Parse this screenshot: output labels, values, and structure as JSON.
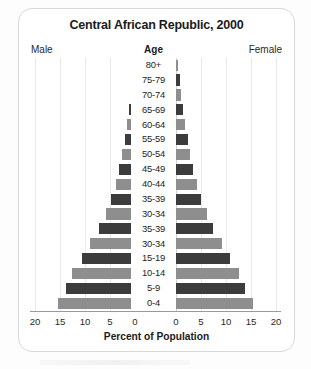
{
  "chart_data": {
    "type": "bar",
    "subtype": "population-pyramid",
    "title": "Central African Republic, 2000",
    "xlabel": "Percent of Population",
    "ylabel": "Age",
    "left_series_label": "Male",
    "right_series_label": "Female",
    "grid": true,
    "legend": "none",
    "xlim_left": [
      20,
      0
    ],
    "xlim_right": [
      0,
      20
    ],
    "xticks_left": [
      "20",
      "15",
      "10",
      "5",
      "0"
    ],
    "xticks_right": [
      "0",
      "5",
      "10",
      "15",
      "20"
    ],
    "categories": [
      "80+",
      "75-79",
      "70-74",
      "65-69",
      "60-64",
      "55-59",
      "50-54",
      "45-49",
      "40-44",
      "35-39",
      "30-34",
      "35-39",
      "30-34",
      "15-19",
      "10-14",
      "5-9",
      "0-4"
    ],
    "series": [
      {
        "name": "Male",
        "side": "left",
        "values": [
          0.3,
          0.6,
          0.9,
          1.3,
          1.7,
          2.1,
          2.6,
          3.2,
          3.9,
          4.8,
          5.9,
          7.3,
          9.0,
          10.6,
          12.6,
          13.9,
          15.5
        ]
      },
      {
        "name": "Female",
        "side": "right",
        "values": [
          0.4,
          0.7,
          1.0,
          1.4,
          1.8,
          2.3,
          2.8,
          3.4,
          4.1,
          5.0,
          6.1,
          7.4,
          9.1,
          10.7,
          12.5,
          13.8,
          15.3
        ]
      }
    ],
    "colors": {
      "bar_dark": "#3c3c3c",
      "bar_light": "#8e8e8e",
      "gridline": "#e9e9e9",
      "axis": "#d2d2d2",
      "frame": "#d8d8d8",
      "text": "#1b1b1b"
    }
  },
  "axis": {
    "ticks_left": [
      {
        "label": "20",
        "x": 35
      },
      {
        "label": "15",
        "x": 60
      },
      {
        "label": "10",
        "x": 85
      },
      {
        "label": "5",
        "x": 110
      },
      {
        "label": "0",
        "x": 135
      }
    ],
    "ticks_right": [
      {
        "label": "0",
        "x": 176
      },
      {
        "label": "5",
        "x": 201
      },
      {
        "label": "10",
        "x": 226
      },
      {
        "label": "15",
        "x": 251
      },
      {
        "label": "20",
        "x": 276
      }
    ]
  }
}
